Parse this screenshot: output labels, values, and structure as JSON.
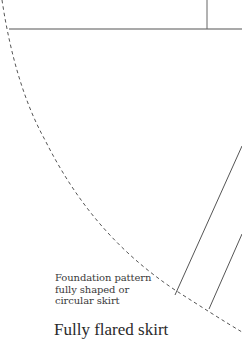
{
  "figure": {
    "title": "Fully flared skirt",
    "caption_lines": [
      "Foundation pattern",
      "fully shaped or",
      "circular skirt"
    ],
    "colors": {
      "line": "#555555",
      "text": "#333333",
      "background": "#ffffff"
    },
    "elements": {
      "waist_line": "horizontal solid line",
      "center_line": "vertical solid line",
      "hem_curve": "dashed arc",
      "panel_lines": [
        "solid diagonal line 1",
        "solid diagonal line 2"
      ]
    }
  }
}
